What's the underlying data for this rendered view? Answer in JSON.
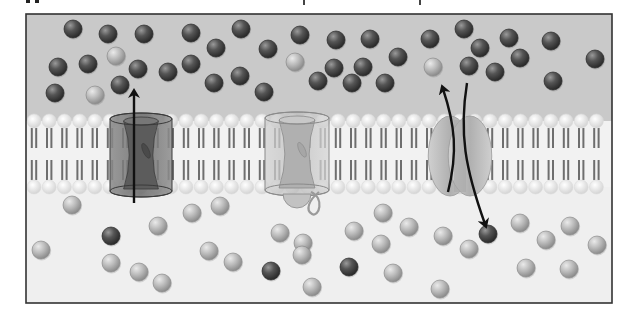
{
  "figure": {
    "frame": {
      "x": 26,
      "y": 14,
      "width": 586,
      "height": 289
    },
    "colors": {
      "extracellular_bg": "#c9c9c9",
      "intracellular_bg": "#efefef",
      "frame_stroke": "#333333",
      "dark_solute": "#4a4a4a",
      "light_solute": "#b5b5b5",
      "lipid_head": "#f4f4f4",
      "lipid_tail": "#6e6e6e",
      "arrow": "#111111"
    },
    "membrane": {
      "top_head_y": 121,
      "bottom_head_y": 187,
      "head_radius": 7
    },
    "proteins": [
      {
        "name": "open-channel",
        "type": "channel",
        "state": "open",
        "x": 110,
        "y": 113,
        "w": 62,
        "h": 84,
        "tone": "dark"
      },
      {
        "name": "gated-channel",
        "type": "channel",
        "state": "closed",
        "x": 265,
        "y": 112,
        "w": 64,
        "h": 84,
        "tone": "light"
      },
      {
        "name": "carrier-protein",
        "type": "carrier",
        "x": 428,
        "y": 116,
        "w": 64,
        "h": 80
      }
    ],
    "arrows": [
      {
        "name": "channel-influx-arrow",
        "from": [
          134,
          203
        ],
        "to": [
          134,
          89
        ]
      },
      {
        "name": "carrier-outward-arrow",
        "from": [
          448,
          192
        ],
        "to": [
          443,
          85
        ]
      },
      {
        "name": "carrier-inward-arrow",
        "from": [
          467,
          83
        ],
        "to": [
          485,
          228
        ]
      }
    ],
    "solutes_top": [
      {
        "x": 73,
        "y": 29,
        "t": "d"
      },
      {
        "x": 108,
        "y": 34,
        "t": "d"
      },
      {
        "x": 144,
        "y": 34,
        "t": "d"
      },
      {
        "x": 191,
        "y": 33,
        "t": "d"
      },
      {
        "x": 216,
        "y": 48,
        "t": "d"
      },
      {
        "x": 58,
        "y": 67,
        "t": "d"
      },
      {
        "x": 88,
        "y": 64,
        "t": "d"
      },
      {
        "x": 116,
        "y": 56,
        "t": "l"
      },
      {
        "x": 138,
        "y": 69,
        "t": "d"
      },
      {
        "x": 168,
        "y": 72,
        "t": "d"
      },
      {
        "x": 191,
        "y": 64,
        "t": "d"
      },
      {
        "x": 55,
        "y": 93,
        "t": "d"
      },
      {
        "x": 95,
        "y": 95,
        "t": "l"
      },
      {
        "x": 120,
        "y": 85,
        "t": "d"
      },
      {
        "x": 214,
        "y": 83,
        "t": "d"
      },
      {
        "x": 241,
        "y": 29,
        "t": "d"
      },
      {
        "x": 268,
        "y": 49,
        "t": "d"
      },
      {
        "x": 300,
        "y": 35,
        "t": "d"
      },
      {
        "x": 295,
        "y": 62,
        "t": "l"
      },
      {
        "x": 240,
        "y": 76,
        "t": "d"
      },
      {
        "x": 264,
        "y": 92,
        "t": "d"
      },
      {
        "x": 336,
        "y": 40,
        "t": "d"
      },
      {
        "x": 370,
        "y": 39,
        "t": "d"
      },
      {
        "x": 318,
        "y": 81,
        "t": "d"
      },
      {
        "x": 334,
        "y": 68,
        "t": "d"
      },
      {
        "x": 363,
        "y": 67,
        "t": "d"
      },
      {
        "x": 398,
        "y": 57,
        "t": "d"
      },
      {
        "x": 352,
        "y": 83,
        "t": "d"
      },
      {
        "x": 385,
        "y": 83,
        "t": "d"
      },
      {
        "x": 430,
        "y": 39,
        "t": "d"
      },
      {
        "x": 464,
        "y": 29,
        "t": "d"
      },
      {
        "x": 480,
        "y": 48,
        "t": "d"
      },
      {
        "x": 509,
        "y": 38,
        "t": "d"
      },
      {
        "x": 433,
        "y": 67,
        "t": "l"
      },
      {
        "x": 469,
        "y": 66,
        "t": "d"
      },
      {
        "x": 495,
        "y": 72,
        "t": "d"
      },
      {
        "x": 520,
        "y": 58,
        "t": "d"
      },
      {
        "x": 551,
        "y": 41,
        "t": "d"
      },
      {
        "x": 553,
        "y": 81,
        "t": "d"
      },
      {
        "x": 595,
        "y": 59,
        "t": "d"
      }
    ],
    "solutes_bottom": [
      {
        "x": 72,
        "y": 205,
        "t": "l"
      },
      {
        "x": 158,
        "y": 226,
        "t": "l"
      },
      {
        "x": 192,
        "y": 213,
        "t": "l"
      },
      {
        "x": 220,
        "y": 206,
        "t": "l"
      },
      {
        "x": 111,
        "y": 236,
        "t": "d"
      },
      {
        "x": 41,
        "y": 250,
        "t": "l"
      },
      {
        "x": 111,
        "y": 263,
        "t": "l"
      },
      {
        "x": 139,
        "y": 272,
        "t": "l"
      },
      {
        "x": 162,
        "y": 283,
        "t": "l"
      },
      {
        "x": 209,
        "y": 251,
        "t": "l"
      },
      {
        "x": 233,
        "y": 262,
        "t": "l"
      },
      {
        "x": 280,
        "y": 233,
        "t": "l"
      },
      {
        "x": 303,
        "y": 243,
        "t": "l"
      },
      {
        "x": 271,
        "y": 271,
        "t": "d"
      },
      {
        "x": 302,
        "y": 255,
        "t": "l"
      },
      {
        "x": 312,
        "y": 287,
        "t": "l"
      },
      {
        "x": 354,
        "y": 231,
        "t": "l"
      },
      {
        "x": 383,
        "y": 213,
        "t": "l"
      },
      {
        "x": 409,
        "y": 227,
        "t": "l"
      },
      {
        "x": 381,
        "y": 244,
        "t": "l"
      },
      {
        "x": 349,
        "y": 267,
        "t": "d"
      },
      {
        "x": 393,
        "y": 273,
        "t": "l"
      },
      {
        "x": 443,
        "y": 236,
        "t": "l"
      },
      {
        "x": 469,
        "y": 249,
        "t": "l"
      },
      {
        "x": 488,
        "y": 234,
        "t": "d"
      },
      {
        "x": 440,
        "y": 289,
        "t": "l"
      },
      {
        "x": 520,
        "y": 223,
        "t": "l"
      },
      {
        "x": 546,
        "y": 240,
        "t": "l"
      },
      {
        "x": 570,
        "y": 226,
        "t": "l"
      },
      {
        "x": 597,
        "y": 245,
        "t": "l"
      },
      {
        "x": 526,
        "y": 268,
        "t": "l"
      },
      {
        "x": 569,
        "y": 269,
        "t": "l"
      }
    ]
  }
}
